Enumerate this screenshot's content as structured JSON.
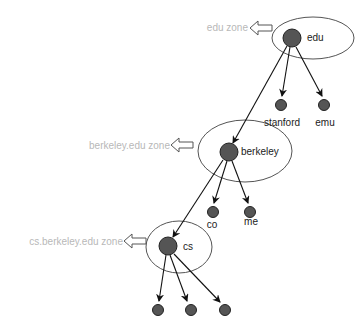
{
  "diagram": {
    "type": "DNS zone hierarchy",
    "colors": {
      "node_fill": "#555555",
      "node_stroke": "#222222",
      "edge": "#111111",
      "zone_ellipse": "#444444",
      "zone_label": "#b8b8b8",
      "zone_arrow": "#444444"
    },
    "zones": [
      {
        "id": "edu-zone",
        "label": "edu zone"
      },
      {
        "id": "berkeley-zone",
        "label": "berkeley.edu zone"
      },
      {
        "id": "cs-zone",
        "label": "cs.berkeley.edu zone"
      }
    ],
    "nodes": [
      {
        "id": "edu",
        "label": "edu"
      },
      {
        "id": "stanford",
        "label": "stanford"
      },
      {
        "id": "emu",
        "label": "emu"
      },
      {
        "id": "berkeley",
        "label": "berkeley"
      },
      {
        "id": "co",
        "label": "co"
      },
      {
        "id": "me",
        "label": "me"
      },
      {
        "id": "cs",
        "label": "cs"
      },
      {
        "id": "cs-child-1",
        "label": ""
      },
      {
        "id": "cs-child-2",
        "label": ""
      },
      {
        "id": "cs-child-3",
        "label": ""
      }
    ],
    "edges": [
      {
        "from": "edu",
        "to": "stanford"
      },
      {
        "from": "edu",
        "to": "emu"
      },
      {
        "from": "edu",
        "to": "berkeley"
      },
      {
        "from": "berkeley",
        "to": "co"
      },
      {
        "from": "berkeley",
        "to": "me"
      },
      {
        "from": "berkeley",
        "to": "cs"
      },
      {
        "from": "cs",
        "to": "cs-child-1"
      },
      {
        "from": "cs",
        "to": "cs-child-2"
      },
      {
        "from": "cs",
        "to": "cs-child-3"
      }
    ]
  }
}
